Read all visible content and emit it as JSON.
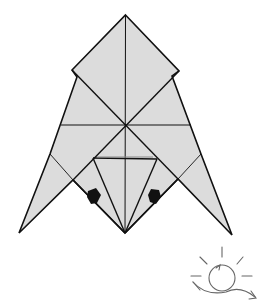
{
  "diagram": {
    "title": "Origami fold step",
    "paper_fill": "#dcdcdc",
    "line_color": "#111111",
    "symbol": "turn-over",
    "symbol_color": "#666666"
  }
}
